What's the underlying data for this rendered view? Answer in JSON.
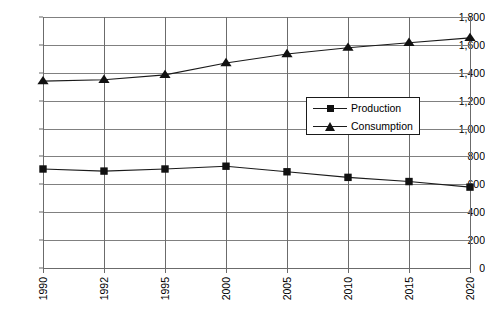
{
  "chart_data": {
    "type": "line",
    "title": "",
    "subtitle": "",
    "xlabel": "",
    "ylabel": "",
    "categories": [
      "1990",
      "1992",
      "1995",
      "2000",
      "2005",
      "2010",
      "2015",
      "2020"
    ],
    "x_tick_labels": [
      "1990",
      "1992",
      "1995",
      "2000",
      "2005",
      "2010",
      "2015",
      "2020"
    ],
    "x_tick_rotation": -90,
    "y_tick_labels": [
      "1,800",
      "1,600",
      "1,400",
      "1,200",
      "1,000",
      "800",
      "600",
      "400",
      "200",
      "0"
    ],
    "y_tick_values": [
      1800,
      1600,
      1400,
      1200,
      1000,
      800,
      600,
      400,
      200,
      0
    ],
    "ylim": [
      0,
      1800
    ],
    "y_step": 200,
    "grid": {
      "horizontal": true,
      "vertical": true,
      "color": "#808080"
    },
    "legend": {
      "position": "center-right-inside",
      "entries": [
        {
          "label": "Production",
          "marker": "square",
          "color": "#111111"
        },
        {
          "label": "Consumption",
          "marker": "triangle",
          "color": "#111111"
        }
      ]
    },
    "series": [
      {
        "name": "Production",
        "marker": "square",
        "color": "#111111",
        "values": [
          710,
          695,
          710,
          730,
          690,
          650,
          620,
          580
        ]
      },
      {
        "name": "Consumption",
        "marker": "triangle",
        "color": "#111111",
        "values": [
          1340,
          1350,
          1385,
          1470,
          1535,
          1580,
          1615,
          1650
        ]
      }
    ]
  }
}
